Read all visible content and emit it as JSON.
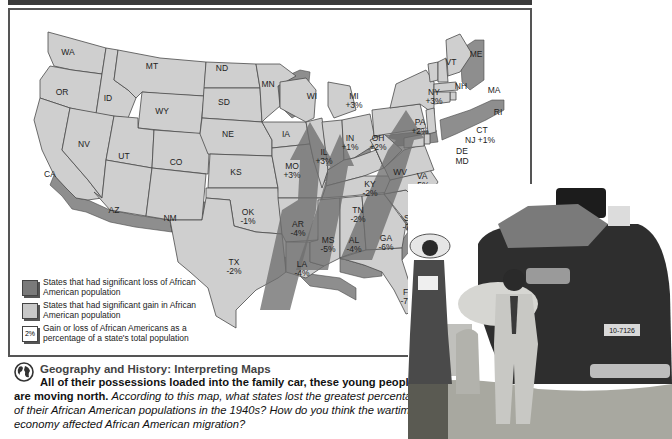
{
  "map": {
    "header_bar_color": "#3a3a3a",
    "frame_color": "#555555",
    "state_fill": "#cfcfcf",
    "arrow_fill": "#6e6e6e",
    "states": [
      {
        "abbr": "WA",
        "pct": ""
      },
      {
        "abbr": "OR",
        "pct": ""
      },
      {
        "abbr": "CA",
        "pct": ""
      },
      {
        "abbr": "ID",
        "pct": ""
      },
      {
        "abbr": "NV",
        "pct": ""
      },
      {
        "abbr": "MT",
        "pct": ""
      },
      {
        "abbr": "WY",
        "pct": ""
      },
      {
        "abbr": "UT",
        "pct": ""
      },
      {
        "abbr": "AZ",
        "pct": ""
      },
      {
        "abbr": "CO",
        "pct": ""
      },
      {
        "abbr": "NM",
        "pct": ""
      },
      {
        "abbr": "ND",
        "pct": ""
      },
      {
        "abbr": "SD",
        "pct": ""
      },
      {
        "abbr": "NE",
        "pct": ""
      },
      {
        "abbr": "KS",
        "pct": ""
      },
      {
        "abbr": "OK",
        "pct": "-1%"
      },
      {
        "abbr": "TX",
        "pct": "-2%"
      },
      {
        "abbr": "MN",
        "pct": ""
      },
      {
        "abbr": "IA",
        "pct": ""
      },
      {
        "abbr": "MO",
        "pct": "+3%"
      },
      {
        "abbr": "AR",
        "pct": "-4%"
      },
      {
        "abbr": "LA",
        "pct": "-4%"
      },
      {
        "abbr": "WI",
        "pct": ""
      },
      {
        "abbr": "IL",
        "pct": "+3%"
      },
      {
        "abbr": "MI",
        "pct": "+3%"
      },
      {
        "abbr": "IN",
        "pct": "+1%"
      },
      {
        "abbr": "OH",
        "pct": "+2%"
      },
      {
        "abbr": "KY",
        "pct": "-2%"
      },
      {
        "abbr": "TN",
        "pct": "-2%"
      },
      {
        "abbr": "MS",
        "pct": "-5%"
      },
      {
        "abbr": "AL",
        "pct": "-4%"
      },
      {
        "abbr": "GA",
        "pct": "-6%"
      },
      {
        "abbr": "FL",
        "pct": "-7%"
      },
      {
        "abbr": "SC",
        "pct": "-7%"
      },
      {
        "abbr": "NC",
        "pct": "-3%"
      },
      {
        "abbr": "VA",
        "pct": "-5%"
      },
      {
        "abbr": "WV",
        "pct": ""
      },
      {
        "abbr": "PA",
        "pct": "+2%"
      },
      {
        "abbr": "NY",
        "pct": "+3%"
      },
      {
        "abbr": "VT",
        "pct": ""
      },
      {
        "abbr": "NH",
        "pct": ""
      },
      {
        "abbr": "ME",
        "pct": ""
      },
      {
        "abbr": "MA",
        "pct": ""
      },
      {
        "abbr": "RI",
        "pct": ""
      },
      {
        "abbr": "CT",
        "pct": ""
      },
      {
        "abbr": "NJ",
        "pct": "+1%"
      },
      {
        "abbr": "DE",
        "pct": ""
      },
      {
        "abbr": "MD",
        "pct": ""
      }
    ]
  },
  "legend": {
    "loss": "States that had significant loss of African American population",
    "gain": "States that had significant gain in African American population",
    "pct_swatch": "2%",
    "pct": "Gain or loss of African Americans as a percentage of a state's total population"
  },
  "caption": {
    "icon": "globe-icon",
    "title": "Geography and History: Interpreting Maps",
    "lead": "All of their possessions loaded into the family car, these young people are moving north.",
    "question": "According to this map, what states lost the greatest percentage of their African American populations in the 1940s? How do you think the wartime economy affected African American migration?"
  },
  "photo": {
    "license_plate": "10-7126"
  }
}
